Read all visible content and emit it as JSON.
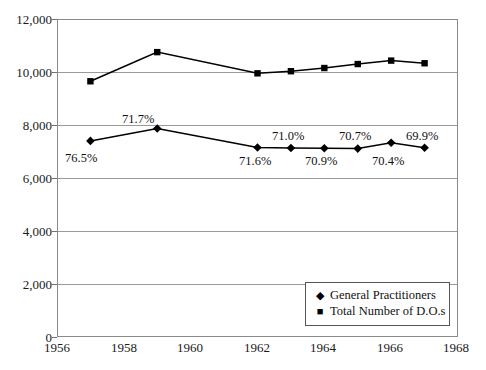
{
  "chart_data": {
    "type": "line",
    "title": "",
    "subtitle": "",
    "xlabel": "",
    "ylabel": "",
    "xlim": [
      1956,
      1968
    ],
    "ylim": [
      0,
      12000
    ],
    "grid": true,
    "legend_position": "bottom-right",
    "x_tick_labels": [
      "1956",
      "1958",
      "1960",
      "1962",
      "1964",
      "1966",
      "1968"
    ],
    "x_tick_values": [
      1956,
      1958,
      1960,
      1962,
      1964,
      1966,
      1968
    ],
    "y_tick_labels": [
      "0",
      "2,000",
      "4,000",
      "6,000",
      "8,000",
      "10,000",
      "12,000"
    ],
    "y_tick_values": [
      0,
      2000,
      4000,
      6000,
      8000,
      10000,
      12000
    ],
    "series": [
      {
        "name": "General Practitioners",
        "marker": "diamond",
        "color": "#000000",
        "x": [
          1957,
          1959,
          1962,
          1963,
          1964,
          1965,
          1966,
          1967
        ],
        "values": [
          7400,
          7870,
          7150,
          7130,
          7120,
          7110,
          7330,
          7140
        ]
      },
      {
        "name": "Total Number of D.O.s",
        "marker": "square",
        "color": "#000000",
        "x": [
          1957,
          1959,
          1962,
          1963,
          1964,
          1965,
          1966,
          1967
        ],
        "values": [
          9650,
          10750,
          9950,
          10030,
          10150,
          10300,
          10430,
          10330
        ]
      }
    ],
    "annotations": [
      {
        "text": "76.5%",
        "x": 1957,
        "position": "below"
      },
      {
        "text": "71.7%",
        "x": 1959,
        "position": "above"
      },
      {
        "text": "71.6%",
        "x": 1962,
        "position": "below"
      },
      {
        "text": "71.0%",
        "x": 1963,
        "position": "above"
      },
      {
        "text": "70.9%",
        "x": 1964,
        "position": "below"
      },
      {
        "text": "70.7%",
        "x": 1965,
        "position": "above"
      },
      {
        "text": "70.4%",
        "x": 1966,
        "position": "below"
      },
      {
        "text": "69.9%",
        "x": 1967,
        "position": "above"
      }
    ]
  },
  "axes": {
    "y_ticks": [
      {
        "label": "12,000"
      },
      {
        "label": "10,000"
      },
      {
        "label": "8,000"
      },
      {
        "label": "6,000"
      },
      {
        "label": "4,000"
      },
      {
        "label": "2,000"
      },
      {
        "label": "0"
      }
    ],
    "x_ticks": [
      {
        "label": "1956"
      },
      {
        "label": "1958"
      },
      {
        "label": "1960"
      },
      {
        "label": "1962"
      },
      {
        "label": "1964"
      },
      {
        "label": "1966"
      },
      {
        "label": "1968"
      }
    ]
  },
  "labels": {
    "pct_1957": "76.5%",
    "pct_1959": "71.7%",
    "pct_1962": "71.6%",
    "pct_1963": "71.0%",
    "pct_1964": "70.9%",
    "pct_1965": "70.7%",
    "pct_1966": "70.4%",
    "pct_1967": "69.9%"
  },
  "legend": {
    "items": [
      {
        "glyph": "diamond-marker-icon",
        "symbol": "◆",
        "label": "General Practitioners"
      },
      {
        "glyph": "square-marker-icon",
        "symbol": "■",
        "label": "Total Number of D.O.s"
      }
    ]
  },
  "colors": {
    "series": "#000000",
    "gridline": "#9a9a9a",
    "frame": "#8a8a8a",
    "text": "#111111",
    "background": "#ffffff"
  }
}
